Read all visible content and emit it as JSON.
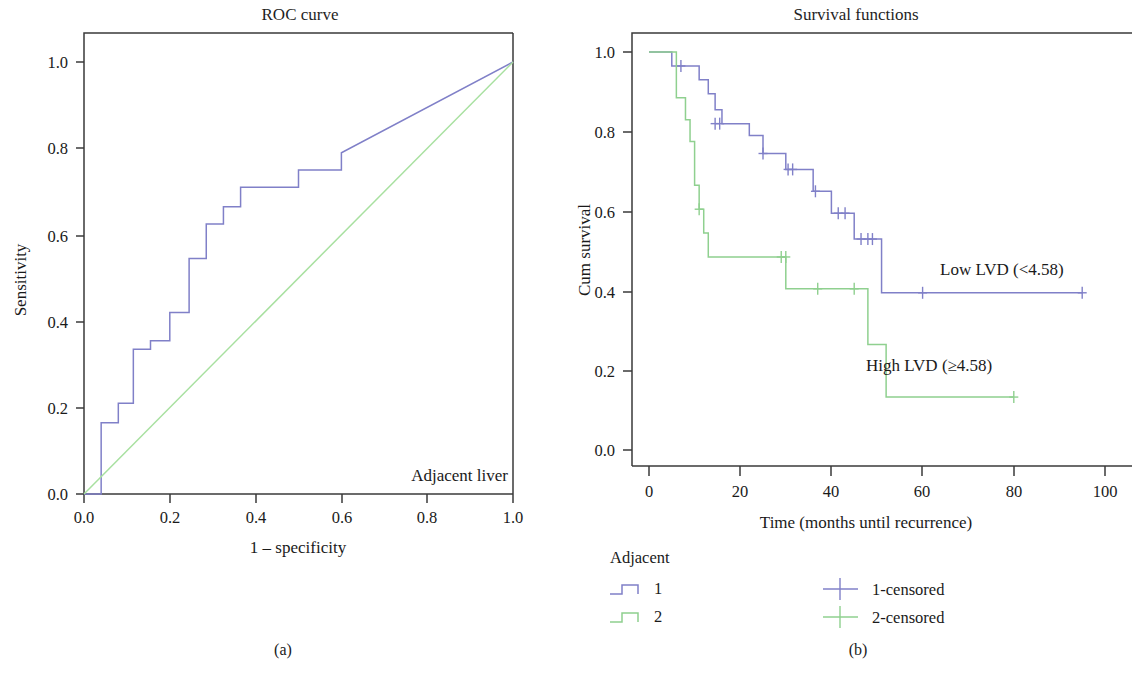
{
  "figure": {
    "panel_a_caption": "(a)",
    "panel_b_caption": "(b)"
  },
  "colors": {
    "series_1_blue": "#8080c8",
    "series_2_green": "#8fd08f",
    "reference_diagonal_green": "#a8e0a0",
    "axis": "#3a3a3a",
    "text": "#1a1a1a",
    "background": "#ffffff"
  },
  "panel_a": {
    "title": "ROC curve",
    "xlabel": "1 – specificity",
    "ylabel": "Sensitivity",
    "annotation": "Adjacent liver",
    "x_ticks": [
      "0.0",
      "0.2",
      "0.4",
      "0.6",
      "0.8",
      "1.0"
    ],
    "y_ticks": [
      "0.0",
      "0.2",
      "0.4",
      "0.6",
      "0.8",
      "1.0"
    ]
  },
  "panel_b": {
    "title": "Survival functions",
    "xlabel": "Time (months until recurrence)",
    "ylabel": "Cum survival",
    "x_ticks": [
      "0",
      "20",
      "40",
      "60",
      "80",
      "100"
    ],
    "y_ticks": [
      "0.0",
      "0.2",
      "0.4",
      "0.6",
      "0.8",
      "1.0"
    ],
    "annotation_low": "Low LVD (<4.58)",
    "annotation_high": "High LVD (≥4.58)",
    "legend": {
      "header": "Adjacent",
      "items": [
        {
          "label": "1",
          "color": "#8080c8"
        },
        {
          "label": "2",
          "color": "#8fd08f"
        }
      ],
      "censored_items": [
        {
          "label": "1-censored",
          "color": "#8080c8"
        },
        {
          "label": "2-censored",
          "color": "#8fd08f"
        }
      ]
    }
  },
  "chart_data": [
    {
      "type": "line",
      "title": "ROC curve",
      "xlabel": "1 – specificity",
      "ylabel": "Sensitivity",
      "xlim": [
        0.0,
        1.0
      ],
      "ylim": [
        0.0,
        1.0
      ],
      "grid": false,
      "annotation": "Adjacent liver",
      "series": [
        {
          "name": "ROC curve (Adjacent liver)",
          "color": "#8080c8",
          "style": "step",
          "points": [
            [
              0.0,
              0.0
            ],
            [
              0.04,
              0.0
            ],
            [
              0.04,
              0.165
            ],
            [
              0.08,
              0.165
            ],
            [
              0.08,
              0.21
            ],
            [
              0.115,
              0.21
            ],
            [
              0.115,
              0.335
            ],
            [
              0.155,
              0.335
            ],
            [
              0.155,
              0.355
            ],
            [
              0.2,
              0.355
            ],
            [
              0.2,
              0.42
            ],
            [
              0.245,
              0.42
            ],
            [
              0.245,
              0.545
            ],
            [
              0.285,
              0.545
            ],
            [
              0.285,
              0.625
            ],
            [
              0.325,
              0.625
            ],
            [
              0.325,
              0.665
            ],
            [
              0.365,
              0.665
            ],
            [
              0.365,
              0.71
            ],
            [
              0.5,
              0.71
            ],
            [
              0.5,
              0.75
            ],
            [
              0.6,
              0.75
            ],
            [
              0.6,
              0.79
            ],
            [
              1.0,
              1.0
            ]
          ]
        },
        {
          "name": "Reference line",
          "color": "#a8e0a0",
          "style": "straight",
          "points": [
            [
              0.0,
              0.0
            ],
            [
              1.0,
              1.0
            ]
          ]
        }
      ]
    },
    {
      "type": "line",
      "title": "Survival functions",
      "xlabel": "Time (months until recurrence)",
      "ylabel": "Cum survival",
      "xlim": [
        -4,
        104
      ],
      "ylim": [
        0.0,
        1.04
      ],
      "grid": false,
      "legend_position": "below",
      "series": [
        {
          "name": "1",
          "label": "Low LVD (<4.58)",
          "color": "#8080c8",
          "style": "step",
          "points": [
            [
              0,
              1.0
            ],
            [
              5,
              1.0
            ],
            [
              5,
              0.965
            ],
            [
              11,
              0.965
            ],
            [
              11,
              0.93
            ],
            [
              13,
              0.93
            ],
            [
              13,
              0.895
            ],
            [
              14.5,
              0.895
            ],
            [
              14.5,
              0.855
            ],
            [
              16,
              0.855
            ],
            [
              16,
              0.82
            ],
            [
              22,
              0.82
            ],
            [
              22,
              0.79
            ],
            [
              25,
              0.79
            ],
            [
              25,
              0.745
            ],
            [
              30,
              0.745
            ],
            [
              30,
              0.705
            ],
            [
              36,
              0.705
            ],
            [
              36,
              0.65
            ],
            [
              40,
              0.65
            ],
            [
              40,
              0.595
            ],
            [
              45,
              0.595
            ],
            [
              45,
              0.53
            ],
            [
              51,
              0.53
            ],
            [
              51,
              0.395
            ],
            [
              95,
              0.395
            ]
          ],
          "censored_at": [
            [
              7,
              0.965
            ],
            [
              14.5,
              0.82
            ],
            [
              15.5,
              0.82
            ],
            [
              25,
              0.745
            ],
            [
              30.5,
              0.705
            ],
            [
              31.5,
              0.705
            ],
            [
              36.5,
              0.65
            ],
            [
              41.5,
              0.595
            ],
            [
              43,
              0.595
            ],
            [
              46.5,
              0.53
            ],
            [
              48,
              0.53
            ],
            [
              49,
              0.53
            ],
            [
              60,
              0.395
            ],
            [
              95,
              0.395
            ]
          ]
        },
        {
          "name": "2",
          "label": "High LVD (≥4.58)",
          "color": "#8fd08f",
          "style": "step",
          "points": [
            [
              0,
              1.0
            ],
            [
              6,
              1.0
            ],
            [
              6,
              0.885
            ],
            [
              8,
              0.885
            ],
            [
              8,
              0.83
            ],
            [
              9,
              0.83
            ],
            [
              9,
              0.775
            ],
            [
              10,
              0.775
            ],
            [
              10,
              0.665
            ],
            [
              11,
              0.665
            ],
            [
              11,
              0.605
            ],
            [
              12,
              0.605
            ],
            [
              12,
              0.545
            ],
            [
              13,
              0.545
            ],
            [
              13,
              0.485
            ],
            [
              30,
              0.485
            ],
            [
              30,
              0.405
            ],
            [
              48,
              0.405
            ],
            [
              48,
              0.265
            ],
            [
              52,
              0.265
            ],
            [
              52,
              0.133
            ],
            [
              80,
              0.133
            ]
          ],
          "censored_at": [
            [
              11,
              0.605
            ],
            [
              29,
              0.485
            ],
            [
              30,
              0.485
            ],
            [
              37,
              0.405
            ],
            [
              45,
              0.405
            ],
            [
              80,
              0.133
            ]
          ]
        }
      ]
    }
  ]
}
